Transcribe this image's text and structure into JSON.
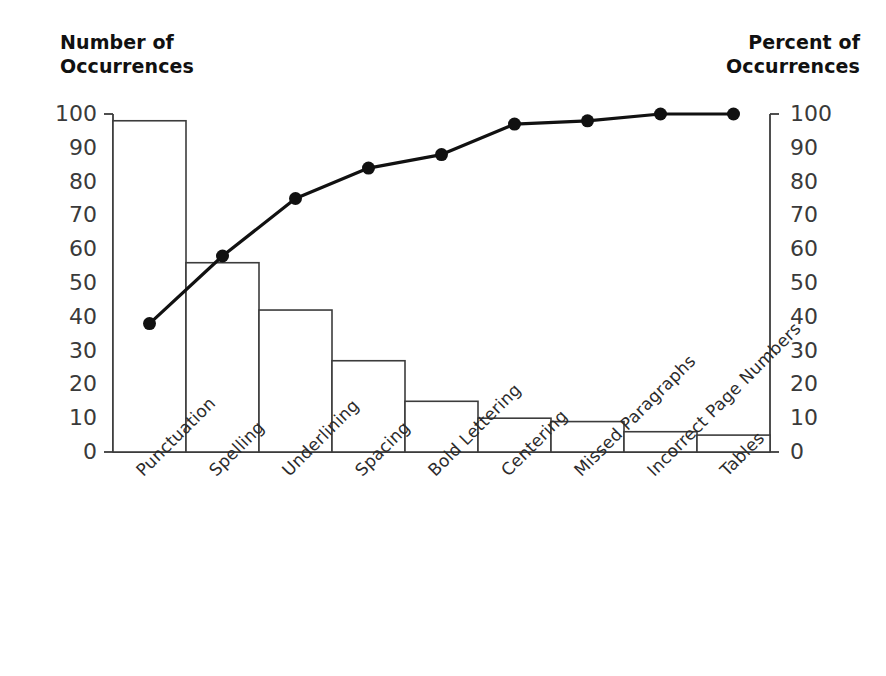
{
  "chart_data": {
    "type": "bar",
    "title": "",
    "subtitle": "",
    "categories": [
      "Punctuation",
      "Spelling",
      "Underlining",
      "Spacing",
      "Bold Lettering",
      "Centering",
      "Missed Paragraphs",
      "Incorrect Page Numbers",
      "Tables"
    ],
    "series": [
      {
        "name": "Number of Occurrences",
        "type": "bar",
        "axis": "left",
        "values": [
          98,
          56,
          42,
          27,
          15,
          10,
          9,
          6,
          5
        ]
      },
      {
        "name": "Percent of Occurrences",
        "type": "line",
        "axis": "right",
        "values": [
          38,
          58,
          75,
          84,
          88,
          97,
          98,
          100,
          100
        ]
      }
    ],
    "xlabel": "",
    "ylabel": "Number of\nOccurrences",
    "y2label": "Percent of\nOccurrences",
    "ylim": [
      0,
      100
    ],
    "y2lim": [
      0,
      100
    ],
    "yticks": [
      100,
      90,
      80,
      70,
      60,
      50,
      40,
      30,
      20,
      10,
      0
    ],
    "y2ticks": [
      100,
      90,
      80,
      70,
      60,
      50,
      40,
      30,
      20,
      10,
      0
    ],
    "grid": false,
    "legend": "none",
    "colors": {
      "bar_fill": "#ffffff",
      "bar_stroke": "#3c3c3c",
      "line": "#111111",
      "marker": "#111111",
      "axis": "#3c3c3c",
      "text": "#1a1a1a"
    }
  },
  "axes": {
    "left_title": "Number of\nOccurrences",
    "right_title": "Percent of\nOccurrences",
    "left_ticks": [
      "100",
      "90",
      "80",
      "70",
      "60",
      "50",
      "40",
      "30",
      "20",
      "10",
      "0"
    ],
    "right_ticks": [
      "100",
      "90",
      "80",
      "70",
      "60",
      "50",
      "40",
      "30",
      "20",
      "10",
      "0"
    ]
  },
  "categories": {
    "c0": "Punctuation",
    "c1": "Spelling",
    "c2": "Underlining",
    "c3": "Spacing",
    "c4": "Bold Lettering",
    "c5": "Centering",
    "c6": "Missed Paragraphs",
    "c7": "Incorrect Page Numbers",
    "c8": "Tables"
  }
}
